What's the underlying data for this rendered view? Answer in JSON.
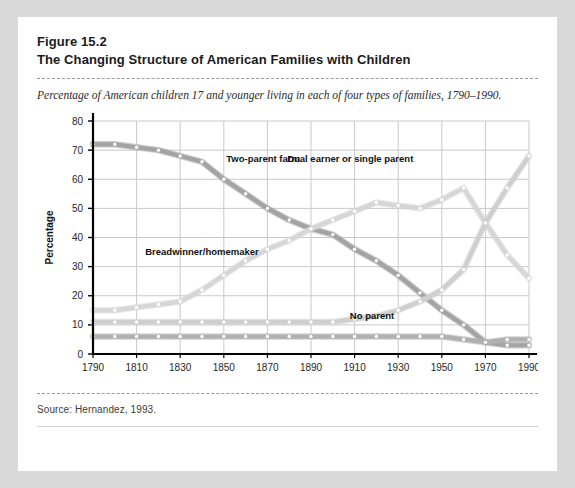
{
  "figure": {
    "number": "Figure 15.2",
    "title": "The Changing Structure of American Families with Children",
    "caption": "Percentage of American children 17 and younger living in each of four types of families, 1790–1990.",
    "source": "Source: Hernandez, 1993."
  },
  "colors": {
    "card_background": "#ffffff",
    "page_background": "#d9d9d9",
    "axis": "#000000",
    "gridline": "#c9c9c9",
    "two_parent_farm": "#a3a3a3",
    "breadwinner_homemaker": "#d6d6d6",
    "dual_earner_or_single_parent": "#cfcfcf",
    "no_parent": "#b0b0b0",
    "marker_fill": "#ffffff",
    "label_text": "#111111",
    "dashed_rule": "#9a9a9a"
  },
  "chart_data": {
    "type": "line",
    "title": "The Changing Structure of American Families with Children",
    "xlabel": "",
    "ylabel": "Percentage",
    "xlim": [
      1790,
      1990
    ],
    "ylim": [
      0,
      80
    ],
    "ytick_step": 10,
    "yticks": [
      0,
      10,
      20,
      30,
      40,
      50,
      60,
      70,
      80
    ],
    "xticks": [
      1790,
      1810,
      1830,
      1850,
      1870,
      1890,
      1910,
      1930,
      1950,
      1970,
      1990
    ],
    "x": [
      1790,
      1800,
      1810,
      1820,
      1830,
      1840,
      1850,
      1860,
      1870,
      1880,
      1890,
      1900,
      1910,
      1920,
      1930,
      1940,
      1950,
      1960,
      1970,
      1980,
      1990
    ],
    "grid": true,
    "legend_position": "inline-annotations",
    "markers": "white-filled circles at each decade",
    "series": [
      {
        "name": "Two-parent farm",
        "color": "#a3a3a3",
        "label_x": 1868,
        "label_y": 66,
        "values": [
          72,
          72,
          71,
          70,
          68,
          66,
          60,
          55,
          50,
          46,
          43,
          41,
          36,
          32,
          27,
          21,
          15,
          10,
          4,
          3,
          3
        ]
      },
      {
        "name": "Breadwinner/homemaker",
        "color": "#d6d6d6",
        "label_x": 1840,
        "label_y": 34,
        "values": [
          15,
          15,
          16,
          17,
          18,
          22,
          27,
          32,
          36,
          39,
          43,
          46,
          49,
          52,
          51,
          50,
          53,
          57,
          45,
          34,
          26
        ]
      },
      {
        "name": "Dual earner or single parent",
        "color": "#cfcfcf",
        "label_x": 1908,
        "label_y": 66,
        "values": [
          11,
          11,
          11,
          11,
          11,
          11,
          11,
          11,
          11,
          11,
          11,
          11,
          12,
          13,
          15,
          18,
          22,
          29,
          45,
          57,
          68
        ]
      },
      {
        "name": "No parent",
        "color": "#b0b0b0",
        "label_x": 1918,
        "label_y": 12,
        "values": [
          6,
          6,
          6,
          6,
          6,
          6,
          6,
          6,
          6,
          6,
          6,
          6,
          6,
          6,
          6,
          6,
          6,
          5,
          4,
          5,
          5
        ]
      }
    ]
  }
}
